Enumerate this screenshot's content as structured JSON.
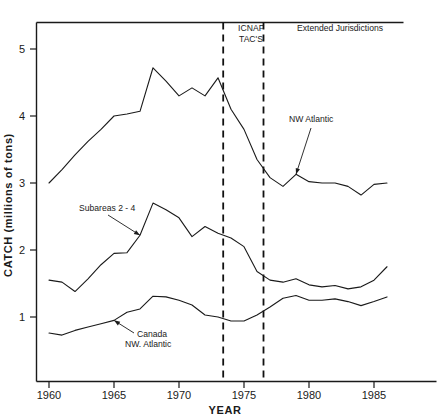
{
  "chart_data": {
    "type": "line",
    "title": "",
    "xlabel": "YEAR",
    "ylabel": "CATCH (millions of tons)",
    "xlim": [
      1959.0,
      1987.2
    ],
    "ylim": [
      0.0,
      5.45
    ],
    "grid": false,
    "legend_position": "inline-annotations",
    "x": [
      1960,
      1961,
      1962,
      1963,
      1964,
      1965,
      1966,
      1967,
      1968,
      1969,
      1970,
      1971,
      1972,
      1973,
      1974,
      1975,
      1976,
      1977,
      1978,
      1979,
      1980,
      1981,
      1982,
      1983,
      1984,
      1985,
      1986
    ],
    "xticks": [
      1960,
      1965,
      1970,
      1975,
      1980,
      1985
    ],
    "xtick_labels": [
      "1960",
      "1965",
      "1970",
      "1975",
      "1980",
      "1985"
    ],
    "yticks": [
      1,
      2,
      3,
      4,
      5
    ],
    "ytick_labels": [
      "1",
      "2",
      "3",
      "4",
      "5"
    ],
    "series": [
      {
        "name": "NW Atlantic",
        "values": [
          3.0,
          3.2,
          3.42,
          3.62,
          3.8,
          4.0,
          4.03,
          4.07,
          4.72,
          4.52,
          4.3,
          4.42,
          4.3,
          4.57,
          4.1,
          3.8,
          3.35,
          3.08,
          2.95,
          3.13,
          3.02,
          3.0,
          3.0,
          2.95,
          2.82,
          2.98,
          3.0
        ]
      },
      {
        "name": "Subareas 2 - 4",
        "values": [
          1.55,
          1.52,
          1.38,
          1.57,
          1.78,
          1.95,
          1.96,
          2.22,
          2.7,
          2.6,
          2.48,
          2.2,
          2.35,
          2.25,
          2.18,
          2.05,
          1.68,
          1.55,
          1.52,
          1.57,
          1.48,
          1.45,
          1.47,
          1.42,
          1.45,
          1.55,
          1.75
        ]
      },
      {
        "name": "Canada NW. Atlantic",
        "values": [
          0.76,
          0.73,
          0.8,
          0.85,
          0.9,
          0.95,
          1.07,
          1.12,
          1.31,
          1.3,
          1.25,
          1.18,
          1.03,
          1.0,
          0.94,
          0.94,
          1.03,
          1.15,
          1.28,
          1.32,
          1.25,
          1.25,
          1.27,
          1.23,
          1.17,
          1.23,
          1.3
        ]
      }
    ],
    "annotations": [
      {
        "name": "nw-atlantic",
        "text": "NW Atlantic",
        "points_to_year": 1979,
        "points_to_value": 3.13
      },
      {
        "name": "subareas-2-4",
        "text": "Subareas 2 - 4",
        "points_to_year": 1967,
        "points_to_value": 2.22
      },
      {
        "name": "canada-nw-atlantic",
        "text_line1": "Canada",
        "text_line2": "NW. Atlantic",
        "points_to_year": 1965,
        "points_to_value": 0.95
      }
    ],
    "event_markers": [
      {
        "name": "icnaf-tacs-start",
        "year": 1973.4
      },
      {
        "name": "icnaf-tacs-end",
        "year": 1976.5
      }
    ],
    "event_labels": [
      {
        "name": "icnaf-tacs",
        "line1": "ICNAF",
        "line2": "TAC'S"
      },
      {
        "name": "extended-jurisdictions",
        "line1": "Extended Jurisdictions"
      }
    ],
    "colors": {
      "line": "#1a1a1a",
      "axis": "#1a1a1a",
      "background": "#ffffff"
    }
  }
}
